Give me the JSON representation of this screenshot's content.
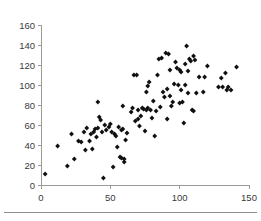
{
  "chart_data": {
    "type": "scatter",
    "title": "",
    "subtitle": "",
    "xlabel": "",
    "ylabel": "",
    "xlim": [
      0,
      150
    ],
    "ylim": [
      0,
      160
    ],
    "xticks": [
      0,
      50,
      100,
      150
    ],
    "yticks": [
      0,
      20,
      40,
      60,
      80,
      100,
      120,
      140,
      160
    ],
    "xtick_labels": [
      "0",
      "50",
      "100",
      "150"
    ],
    "ytick_labels": [
      "0",
      "20",
      "40",
      "60",
      "80",
      "100",
      "120",
      "140",
      "160"
    ],
    "grid": false,
    "legend": null,
    "legend_position": "none",
    "marker": "diamond",
    "marker_color": "#101010",
    "axis_color": "#9a9a9a",
    "point_count": 110,
    "series": [
      {
        "name": "series-1",
        "points": [
          [
            3,
            11
          ],
          [
            12,
            39
          ],
          [
            19,
            19
          ],
          [
            22,
            51
          ],
          [
            24,
            26
          ],
          [
            27,
            44
          ],
          [
            29,
            43
          ],
          [
            31,
            53
          ],
          [
            32,
            35
          ],
          [
            33,
            57
          ],
          [
            35,
            44
          ],
          [
            36,
            51
          ],
          [
            37,
            36
          ],
          [
            38,
            53
          ],
          [
            39,
            56
          ],
          [
            40,
            48
          ],
          [
            41,
            57
          ],
          [
            41,
            83
          ],
          [
            42,
            68
          ],
          [
            43,
            65
          ],
          [
            44,
            53
          ],
          [
            45,
            7
          ],
          [
            46,
            60
          ],
          [
            47,
            55
          ],
          [
            49,
            58
          ],
          [
            50,
            61
          ],
          [
            51,
            53
          ],
          [
            52,
            18
          ],
          [
            53,
            51
          ],
          [
            54,
            49
          ],
          [
            55,
            38
          ],
          [
            56,
            58
          ],
          [
            57,
            28
          ],
          [
            58,
            27
          ],
          [
            58,
            55
          ],
          [
            59,
            79
          ],
          [
            59,
            56
          ],
          [
            60,
            23
          ],
          [
            60,
            26
          ],
          [
            61,
            45
          ],
          [
            62,
            52
          ],
          [
            65,
            73
          ],
          [
            66,
            77
          ],
          [
            67,
            110
          ],
          [
            68,
            64
          ],
          [
            69,
            110
          ],
          [
            70,
            66
          ],
          [
            70,
            75
          ],
          [
            71,
            59
          ],
          [
            72,
            69
          ],
          [
            73,
            77
          ],
          [
            74,
            76
          ],
          [
            75,
            54
          ],
          [
            76,
            75
          ],
          [
            76,
            93
          ],
          [
            77,
            99
          ],
          [
            77,
            77
          ],
          [
            78,
            103
          ],
          [
            79,
            75
          ],
          [
            80,
            67
          ],
          [
            81,
            84
          ],
          [
            82,
            49
          ],
          [
            83,
            74
          ],
          [
            84,
            110
          ],
          [
            85,
            126
          ],
          [
            86,
            78
          ],
          [
            87,
            127
          ],
          [
            88,
            93
          ],
          [
            89,
            88
          ],
          [
            90,
            132
          ],
          [
            91,
            66
          ],
          [
            91,
            96
          ],
          [
            92,
            131
          ],
          [
            93,
            115
          ],
          [
            93,
            89
          ],
          [
            94,
            79
          ],
          [
            95,
            83
          ],
          [
            96,
            101
          ],
          [
            97,
            123
          ],
          [
            98,
            117
          ],
          [
            99,
            100
          ],
          [
            100,
            115
          ],
          [
            100,
            82
          ],
          [
            101,
            95
          ],
          [
            101,
            113
          ],
          [
            102,
            83
          ],
          [
            103,
            62
          ],
          [
            104,
            100
          ],
          [
            104,
            121
          ],
          [
            105,
            139
          ],
          [
            106,
            114
          ],
          [
            106,
            92
          ],
          [
            107,
            126
          ],
          [
            108,
            124
          ],
          [
            109,
            75
          ],
          [
            110,
            129
          ],
          [
            110,
            74
          ],
          [
            111,
            125
          ],
          [
            112,
            92
          ],
          [
            114,
            108
          ],
          [
            117,
            93
          ],
          [
            118,
            108
          ],
          [
            120,
            119
          ],
          [
            128,
            98
          ],
          [
            130,
            107
          ],
          [
            131,
            98
          ],
          [
            133,
            112
          ],
          [
            134,
            95
          ],
          [
            135,
            98
          ],
          [
            137,
            95
          ],
          [
            141,
            118
          ]
        ]
      }
    ]
  },
  "figure": {
    "background_color": "#ffffff",
    "has_bottom_rule": true
  }
}
